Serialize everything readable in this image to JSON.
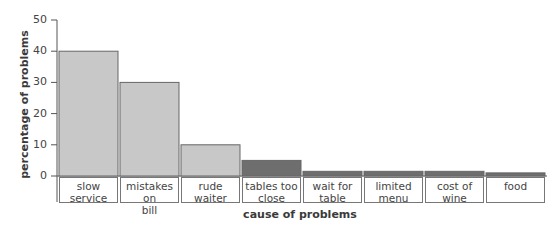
{
  "chart_data": {
    "type": "bar",
    "title": "",
    "xlabel": "cause of problems",
    "ylabel": "percentage of problems",
    "ylim": [
      0,
      50
    ],
    "yticks": [
      0,
      10,
      20,
      30,
      40,
      50
    ],
    "grid": false,
    "legend": null,
    "categories": [
      "slow service",
      "mistakes on bill",
      "rude waiter",
      "tables too close",
      "wait for table",
      "limited menu",
      "cost of wine",
      "food"
    ],
    "category_lines": [
      [
        "slow",
        "service"
      ],
      [
        "mistakes on",
        "bill"
      ],
      [
        "rude",
        "waiter"
      ],
      [
        "tables too",
        "close"
      ],
      [
        "wait for",
        "table"
      ],
      [
        "limited",
        "menu"
      ],
      [
        "cost of",
        "wine"
      ],
      [
        "food",
        ""
      ]
    ],
    "values": [
      40,
      30,
      10,
      5,
      1.5,
      1.5,
      1.5,
      1
    ],
    "colors": [
      "#c8c8c8",
      "#c8c8c8",
      "#c8c8c8",
      "#6e6e6e",
      "#6e6e6e",
      "#6e6e6e",
      "#6e6e6e",
      "#6e6e6e"
    ]
  },
  "axis": {
    "xlabel": "cause of problems",
    "ylabel": "percentage of problems"
  }
}
